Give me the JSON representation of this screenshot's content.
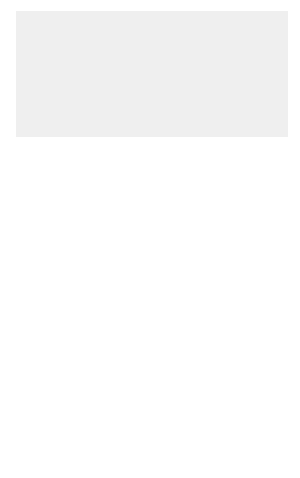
{
  "figure": {
    "background_color": "#efefef",
    "organ_fill": "#cfcfcf",
    "node_fill": "#9a9a9a",
    "line_color": "#555555"
  },
  "labels": {
    "bronchomediastinal_trunks": [
      "bronchomediastinal",
      "trunks"
    ],
    "right_lymphatic_duct": [
      "right",
      "lymphatic",
      "duct"
    ],
    "thoracic_duct": [
      "thoracic",
      "duct"
    ],
    "tracheobronchial_nodes": [
      "tracheobronchial",
      "nodes"
    ],
    "brachiocephalic_nodes": [
      "brachiocephalic",
      "nodes"
    ],
    "posterior_intercostal_nodes": [
      "posterior",
      "intercostal",
      "nodes"
    ],
    "parasternal_nodes": [
      "parasternal",
      "nodes"
    ],
    "posterior_mediastinal_nodes": [
      "posterior",
      "mediastinal",
      "nodes"
    ],
    "diaphragmatic_nodes": [
      "diaphragmatic",
      "nodes"
    ]
  }
}
